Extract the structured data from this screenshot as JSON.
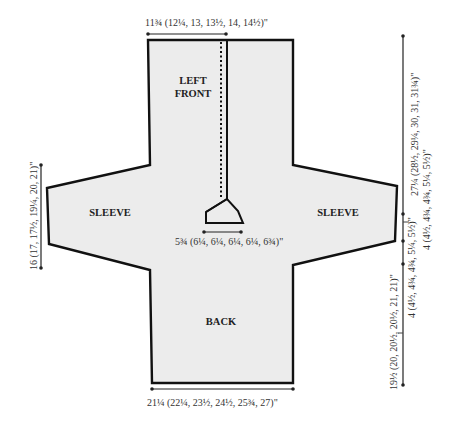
{
  "diagram": {
    "type": "knitting-schematic",
    "pieces": {
      "left_front": {
        "line1": "LEFT",
        "line2": "FRONT"
      },
      "left_sleeve": "SLEEVE",
      "right_sleeve": "SLEEVE",
      "back": "BACK"
    },
    "measurements": {
      "top_width": "11¾ (12¼, 13, 13½, 14, 14½)\"",
      "neck_width": "5¾ (6¼, 6¼, 6¼, 6¼, 6¾)\"",
      "sleeve_cuff": "16 (17, 17½, 19¼, 20, 21)\"",
      "total_length": "27¼ (28½, 29¼, 30, 31, 31¾)\"",
      "upper_sleeve": "4 (4½, 4¾, 4¾, 5¼, 5½)\"",
      "lower_sleeve": "4 (4½, 4¾, 4¾, 5¼, 5½)\"",
      "body_length": "19½ (20, 20½, 20½, 21, 21)\"",
      "bottom_width": "21¼ (22¼, 23½, 24½, 25¾, 27)\""
    },
    "colors": {
      "fill": "#ececec",
      "outline": "#111111",
      "measure_line": "#222222",
      "text": "#333333"
    }
  }
}
